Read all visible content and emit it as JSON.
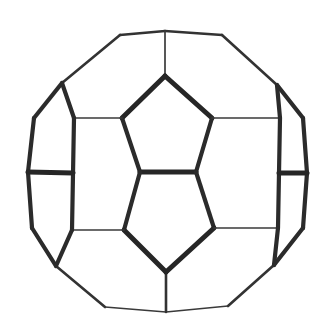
{
  "figure": {
    "title": "Truncated icosahedron (soccer-ball / fullerene C60) wireframe",
    "caption": "",
    "background_color": "#ffffff",
    "stroke_color": "#2e2e2e",
    "canvas": {
      "width": 328,
      "height": 333
    },
    "vertices": {
      "top": [
        165,
        31
      ],
      "top_left": [
        120,
        35
      ],
      "top_right": [
        222,
        35
      ],
      "upper_left": [
        62,
        83
      ],
      "upper_right": [
        277,
        85
      ],
      "left_outer_up": [
        34,
        118
      ],
      "right_outer_up": [
        303,
        118
      ],
      "left_outer_mid_up": [
        28,
        172
      ],
      "right_outer_mid_up": [
        307,
        173
      ],
      "left_outer_mid_dn": [
        32,
        228
      ],
      "right_outer_mid_dn": [
        303,
        228
      ],
      "lower_left": [
        56,
        266
      ],
      "lower_right": [
        274,
        265
      ],
      "bottom_left": [
        105,
        307
      ],
      "bottom_right": [
        228,
        306
      ],
      "bottom": [
        166,
        312
      ],
      "pent_apex": [
        165,
        76
      ],
      "pent_left": [
        122,
        118
      ],
      "pent_right": [
        212,
        118
      ],
      "mid_left": [
        140,
        172
      ],
      "mid_right": [
        196,
        172
      ],
      "low_left": [
        124,
        230
      ],
      "low_right": [
        214,
        228
      ],
      "pent_bottom": [
        166,
        272
      ],
      "side_left_up": [
        74,
        118
      ],
      "side_left_dn": [
        72,
        230
      ],
      "side_right_up": [
        280,
        118
      ],
      "side_right_dn": [
        278,
        228
      ]
    },
    "edges": [
      {
        "name": "outline-top-left",
        "from": "top",
        "to": "top_left",
        "weight": "med"
      },
      {
        "name": "outline-top-right",
        "from": "top",
        "to": "top_right",
        "weight": "med"
      },
      {
        "name": "outline-upper-left",
        "from": "top_left",
        "to": "upper_left",
        "weight": "med"
      },
      {
        "name": "outline-upper-right",
        "from": "top_right",
        "to": "upper_right",
        "weight": "med"
      },
      {
        "name": "outline-left-upper",
        "from": "upper_left",
        "to": "left_outer_up",
        "weight": "thick"
      },
      {
        "name": "outline-right-upper",
        "from": "upper_right",
        "to": "right_outer_up",
        "weight": "thick"
      },
      {
        "name": "outline-left-mid-up",
        "from": "left_outer_up",
        "to": "left_outer_mid_up",
        "weight": "thick"
      },
      {
        "name": "outline-right-mid-up",
        "from": "right_outer_up",
        "to": "right_outer_mid_up",
        "weight": "thick"
      },
      {
        "name": "outline-left-mid-dn",
        "from": "left_outer_mid_up",
        "to": "left_outer_mid_dn",
        "weight": "thick"
      },
      {
        "name": "outline-right-mid-dn",
        "from": "right_outer_mid_up",
        "to": "right_outer_mid_dn",
        "weight": "thick"
      },
      {
        "name": "outline-left-lower",
        "from": "left_outer_mid_dn",
        "to": "lower_left",
        "weight": "thick"
      },
      {
        "name": "outline-right-lower",
        "from": "right_outer_mid_dn",
        "to": "lower_right",
        "weight": "thick"
      },
      {
        "name": "outline-bottom-left",
        "from": "lower_left",
        "to": "bottom_left",
        "weight": "med"
      },
      {
        "name": "outline-bottom-right",
        "from": "lower_right",
        "to": "bottom_right",
        "weight": "med"
      },
      {
        "name": "outline-bottom-left-inner",
        "from": "bottom_left",
        "to": "bottom",
        "weight": "thin"
      },
      {
        "name": "outline-bottom-right-inner",
        "from": "bottom_right",
        "to": "bottom",
        "weight": "thin"
      },
      {
        "name": "spoke-top-pent",
        "from": "top",
        "to": "pent_apex",
        "weight": "thin"
      },
      {
        "name": "spoke-bottom-pent",
        "from": "bottom",
        "to": "pent_bottom",
        "weight": "med"
      },
      {
        "name": "pent-upper-left-edge",
        "from": "pent_apex",
        "to": "pent_left",
        "weight": "xthick"
      },
      {
        "name": "pent-upper-right-edge",
        "from": "pent_apex",
        "to": "pent_right",
        "weight": "xthick"
      },
      {
        "name": "pent-left-side",
        "from": "pent_left",
        "to": "mid_left",
        "weight": "thick"
      },
      {
        "name": "pent-right-side",
        "from": "pent_right",
        "to": "mid_right",
        "weight": "thick"
      },
      {
        "name": "pent-base",
        "from": "mid_left",
        "to": "mid_right",
        "weight": "xthick"
      },
      {
        "name": "lowpent-left-side",
        "from": "mid_left",
        "to": "low_left",
        "weight": "thick"
      },
      {
        "name": "lowpent-right-side",
        "from": "mid_right",
        "to": "low_right",
        "weight": "thick"
      },
      {
        "name": "lowpent-bottom-left",
        "from": "low_left",
        "to": "pent_bottom",
        "weight": "xthick"
      },
      {
        "name": "lowpent-bottom-right",
        "from": "low_right",
        "to": "pent_bottom",
        "weight": "xthick"
      },
      {
        "name": "crossbar-left-upper",
        "from": "side_left_up",
        "to": "pent_left",
        "weight": "thin"
      },
      {
        "name": "crossbar-right-upper",
        "from": "side_right_up",
        "to": "pent_right",
        "weight": "thin"
      },
      {
        "name": "crossbar-left-lower",
        "from": "side_left_dn",
        "to": "low_left",
        "weight": "thin"
      },
      {
        "name": "crossbar-right-lower",
        "from": "side_right_dn",
        "to": "low_right",
        "weight": "thin"
      },
      {
        "name": "left-face-upper-rib",
        "from": "upper_left",
        "to": "side_left_up",
        "weight": "thick"
      },
      {
        "name": "right-face-upper-rib",
        "from": "upper_right",
        "to": "side_right_up",
        "weight": "thick"
      },
      {
        "name": "left-face-vertical-rib",
        "from": "side_left_up",
        "to": "side_left_dn",
        "weight": "thick"
      },
      {
        "name": "right-face-vertical-rib",
        "from": "side_right_up",
        "to": "side_right_dn",
        "weight": "thick"
      },
      {
        "name": "left-face-lower-rib",
        "from": "side_left_dn",
        "to": "lower_left",
        "weight": "thick"
      },
      {
        "name": "right-face-lower-rib",
        "from": "side_right_dn",
        "to": "lower_right",
        "weight": "thick"
      },
      {
        "name": "left-cap-horizontal",
        "from": "left_outer_mid_up",
        "to": "side_left_up_mid",
        "weight": "xthick"
      },
      {
        "name": "right-cap-horizontal",
        "from": "right_outer_mid_up",
        "to": "side_right_up_mid",
        "weight": "xthick"
      }
    ],
    "extra_segments": [
      {
        "name": "left-horizontal-tick",
        "x1": 28,
        "y1": 172,
        "x2": 73,
        "y2": 173,
        "weight": "xthick"
      },
      {
        "name": "right-horizontal-tick",
        "x1": 279,
        "y1": 173,
        "x2": 307,
        "y2": 173,
        "weight": "xthick"
      }
    ]
  }
}
